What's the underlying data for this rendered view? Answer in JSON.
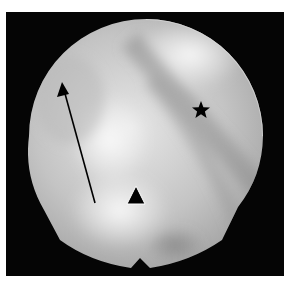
{
  "image": {
    "description": "Grayscale circular endoscopic field of view with annotation markers",
    "background_color": "#050505",
    "page_color": "#ffffff"
  },
  "annotations": [
    {
      "type": "arrow",
      "name": "arrow-marker",
      "from": [
        95,
        203
      ],
      "to": [
        62,
        83
      ],
      "color": "#000000"
    },
    {
      "type": "triangle",
      "name": "triangle-marker",
      "center": [
        136,
        196
      ],
      "color": "#000000"
    },
    {
      "type": "star",
      "name": "star-marker",
      "center": [
        201,
        110
      ],
      "color": "#000000"
    }
  ]
}
